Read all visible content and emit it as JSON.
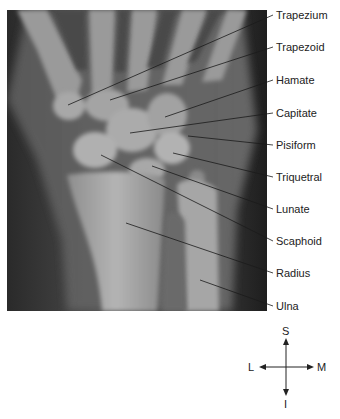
{
  "figure": {
    "labels": [
      {
        "text": "Trapezium",
        "x": 276,
        "y": 9,
        "line_from": [
          68,
          105
        ],
        "line_to": [
          273,
          15
        ]
      },
      {
        "text": "Trapezoid",
        "x": 276,
        "y": 41,
        "line_from": [
          110,
          100
        ],
        "line_to": [
          273,
          47
        ]
      },
      {
        "text": "Hamate",
        "x": 276,
        "y": 74,
        "line_from": [
          165,
          117
        ],
        "line_to": [
          273,
          80
        ]
      },
      {
        "text": "Capitate",
        "x": 276,
        "y": 107,
        "line_from": [
          130,
          133
        ],
        "line_to": [
          273,
          113
        ]
      },
      {
        "text": "Pisiform",
        "x": 276,
        "y": 139,
        "line_from": [
          188,
          136
        ],
        "line_to": [
          273,
          145
        ]
      },
      {
        "text": "Triquetral",
        "x": 276,
        "y": 171,
        "line_from": [
          173,
          153
        ],
        "line_to": [
          273,
          177
        ]
      },
      {
        "text": "Lunate",
        "x": 276,
        "y": 203,
        "line_from": [
          152,
          166
        ],
        "line_to": [
          273,
          209
        ]
      },
      {
        "text": "Scaphoid",
        "x": 276,
        "y": 235,
        "line_from": [
          101,
          155
        ],
        "line_to": [
          273,
          241
        ]
      },
      {
        "text": "Radius",
        "x": 276,
        "y": 267,
        "line_from": [
          126,
          223
        ],
        "line_to": [
          273,
          273
        ]
      },
      {
        "text": "Ulna",
        "x": 276,
        "y": 300,
        "line_from": [
          200,
          280
        ],
        "line_to": [
          273,
          306
        ]
      }
    ]
  },
  "compass": {
    "superior": "S",
    "inferior": "I",
    "lateral": "L",
    "medial": "M"
  }
}
